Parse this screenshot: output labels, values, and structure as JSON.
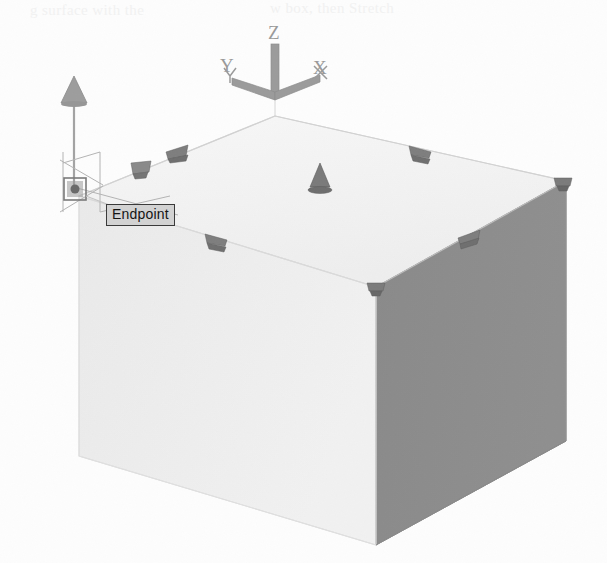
{
  "app": {
    "name": "AutoCAD 3D Modeling Viewport",
    "view_style": "Conceptual shaded isometric / SE isometric view"
  },
  "viewport": {
    "width": 607,
    "height": 563,
    "background_color": "#fdfdfd"
  },
  "ucs_icon": {
    "name": "UCS axis tripod",
    "origin": {
      "x": 275,
      "y": 97
    },
    "axes": [
      {
        "id": "z",
        "label": "Z",
        "direction": "up",
        "label_x": 268,
        "label_y": 23
      },
      {
        "id": "y",
        "label": "Y",
        "direction": "upper-left",
        "label_x": 220,
        "label_y": 56
      },
      {
        "id": "x",
        "label": "X",
        "direction": "upper-right",
        "label_x": 313,
        "label_y": 58
      }
    ],
    "axis_color": "#8c8c8c",
    "label_color": "#9a9a9a"
  },
  "solid": {
    "name": "3D box solid",
    "shape": "box",
    "selected": true,
    "faces": [
      {
        "id": "top",
        "label": "Top face",
        "color": "#f4f4f4"
      },
      {
        "id": "front-left",
        "label": "Front left face",
        "color": "#ededed"
      },
      {
        "id": "right",
        "label": "Right face",
        "color": "#8b8b8b"
      }
    ],
    "edge_color": "#cfcfcf",
    "vertices": {
      "top_back": {
        "x": 275,
        "y": 116
      },
      "top_left": {
        "x": 79,
        "y": 196
      },
      "top_front": {
        "x": 376,
        "y": 287
      },
      "top_right": {
        "x": 566,
        "y": 181
      },
      "bottom_left": {
        "x": 79,
        "y": 456
      },
      "bottom_front": {
        "x": 376,
        "y": 545
      },
      "bottom_right": {
        "x": 566,
        "y": 441
      }
    }
  },
  "grips": {
    "name": "Solid editing grips",
    "color": "#7c7c7c",
    "items": [
      {
        "id": "grip-top-edge-left-mid",
        "type": "arrow-grip",
        "x": 176,
        "y": 150
      },
      {
        "id": "grip-top-edge-right-mid",
        "type": "arrow-grip",
        "x": 421,
        "y": 149
      },
      {
        "id": "grip-corner-top-right",
        "type": "corner-grip",
        "x": 562,
        "y": 182
      },
      {
        "id": "grip-front-edge-left-mid",
        "type": "arrow-grip",
        "x": 215,
        "y": 238
      },
      {
        "id": "grip-front-edge-right-mid",
        "type": "arrow-grip",
        "x": 468,
        "y": 234
      },
      {
        "id": "grip-corner-front",
        "type": "corner-grip",
        "x": 375,
        "y": 288
      },
      {
        "id": "grip-top-face-center",
        "type": "cone-grip",
        "x": 320,
        "y": 177
      },
      {
        "id": "grip-edge-left-arrow",
        "type": "arrow-grip",
        "x": 141,
        "y": 168
      }
    ]
  },
  "gizmo": {
    "name": "Z axis move gizmo",
    "arrow_tip": {
      "x": 74,
      "y": 78
    },
    "arrow_base": {
      "x": 74,
      "y": 186
    },
    "color": "#9d9d9d"
  },
  "snap": {
    "name": "Object snap marker",
    "marker_type": "endpoint-square",
    "marker": {
      "x": 68,
      "y": 182,
      "size": 18
    },
    "marker_color": "#6a6a6a",
    "tooltip": {
      "label": "Endpoint",
      "x": 106,
      "y": 204,
      "background": "#d2d2d2",
      "border_color": "#3a3a3a",
      "text_color": "#141414"
    }
  },
  "crosshair": {
    "name": "Isometric crosshair cursor",
    "center": {
      "x": 77,
      "y": 189
    },
    "color": "#b0b0b0"
  },
  "bleed_through": {
    "note": "Faint show-through of printed text from the reverse of the scanned page",
    "lines": [
      {
        "text": "g surface with the",
        "x": 30,
        "y": 2
      },
      {
        "text": "w box, then Stretch",
        "x": 270,
        "y": 0
      }
    ],
    "color": "#f2f2f2"
  }
}
